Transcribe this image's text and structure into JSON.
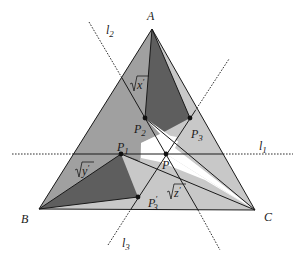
{
  "diagram": {
    "colors": {
      "light": "#c8c8c8",
      "mid": "#9a9a9a",
      "dark": "#5e5e5e",
      "white": "#ffffff",
      "ink": "#1a1a1a"
    },
    "vertices": {
      "A": {
        "label": "A",
        "x": 152,
        "y": 29
      },
      "B": {
        "label": "B",
        "x": 39,
        "y": 209
      },
      "C": {
        "label": "C",
        "x": 255,
        "y": 210
      }
    },
    "points": {
      "P": {
        "label": "P",
        "x": 166,
        "y": 154
      },
      "P1": {
        "label": "P",
        "sub": "1",
        "x": 121,
        "y": 154
      },
      "P2": {
        "label": "P",
        "sub": "2",
        "x": 145,
        "y": 118
      },
      "P3": {
        "label": "P",
        "sub": "3",
        "x": 190,
        "y": 118
      },
      "P3prime": {
        "label": "P",
        "sub": "3",
        "prime": "′",
        "x": 138,
        "y": 197
      }
    },
    "lines": {
      "l1": {
        "label": "l",
        "sub": "1"
      },
      "l2": {
        "label": "l",
        "sub": "2"
      },
      "l3": {
        "label": "l",
        "sub": "3"
      }
    },
    "region_labels": {
      "x": {
        "radical": "√",
        "var": "x",
        "prime": "′"
      },
      "y": {
        "radical": "√",
        "var": "y",
        "prime": "′"
      },
      "z": {
        "radical": "√",
        "var": "z",
        "prime": "′"
      }
    }
  }
}
